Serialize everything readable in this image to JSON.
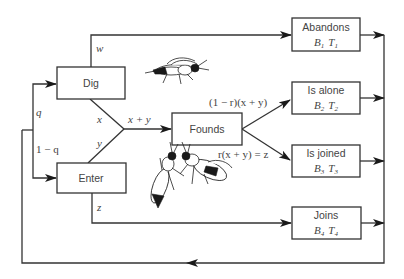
{
  "nodes": {
    "dig": {
      "label": "Dig"
    },
    "enter": {
      "label": "Enter"
    },
    "founds": {
      "label": "Founds"
    },
    "abandons": {
      "label": "Abandons",
      "b": "B",
      "b_sub": "1",
      "t": "T",
      "t_sub": "1"
    },
    "is_alone": {
      "label": "Is alone",
      "b": "B",
      "b_sub": "2",
      "t": "T",
      "t_sub": "2"
    },
    "is_joined": {
      "label": "Is joined",
      "b": "B",
      "b_sub": "3",
      "t": "T",
      "t_sub": "3"
    },
    "joins": {
      "label": "Joins",
      "b": "B",
      "b_sub": "4",
      "t": "T",
      "t_sub": "4"
    }
  },
  "edges": {
    "q": "q",
    "one_minus_q": "1 − q",
    "w": "w",
    "x": "x",
    "y": "y",
    "z": "z",
    "x_plus_y": "x + y",
    "alone_rate": "(1 − r)(x + y)",
    "joined_rate": "r(x + y) = z"
  },
  "illustrations": [
    {
      "name": "single-wasp",
      "description": "wasp illustration near Dig"
    },
    {
      "name": "pair-of-wasps",
      "description": "two wasps illustration near Founds"
    }
  ]
}
